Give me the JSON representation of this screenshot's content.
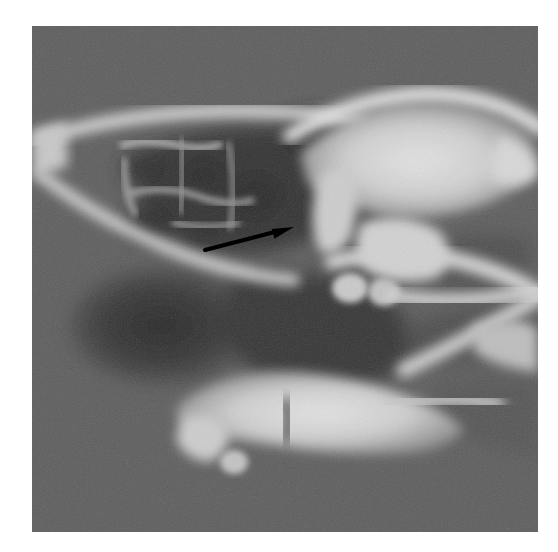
{
  "image": {
    "modality": "CT",
    "type": "axial-temporal-bone-ct",
    "region": "temporal bone / petrous apex",
    "rendering": "grayscale",
    "frame": {
      "x": 32,
      "y": 26,
      "width": 506,
      "height": 506
    },
    "page": {
      "width": 558,
      "height": 552,
      "background": "#ffffff"
    }
  },
  "palette": {
    "page_background": "#ffffff",
    "soft_tissue_background": "#5e5e5e",
    "air_cell_dark": "#2d2d2d",
    "mid_gray": "#747474",
    "bone_bright": "#ededed",
    "bone_mid": "#c6c6c6",
    "annotation_black": "#000000"
  },
  "annotations": [
    {
      "name": "pointer-arrow",
      "shape": "arrow",
      "color": "#000000",
      "tail": {
        "x": 173,
        "y": 224
      },
      "tip": {
        "x": 262,
        "y": 201
      },
      "stroke_width": 4,
      "head_length": 22,
      "head_width": 13,
      "label": ""
    }
  ],
  "anatomy": [
    {
      "name": "mastoid-air-cells",
      "tone": "dark",
      "cx": 150,
      "cy": 180
    },
    {
      "name": "outer-cortical-bone-line",
      "tone": "bright",
      "cx": 120,
      "cy": 140
    },
    {
      "name": "petrous-apex",
      "tone": "bright",
      "cx": 360,
      "cy": 180
    },
    {
      "name": "internal-auditory-canal",
      "tone": "dark",
      "cx": 390,
      "cy": 155
    },
    {
      "name": "sigmoid-sinus-plate",
      "tone": "dark",
      "cx": 130,
      "cy": 300
    },
    {
      "name": "occipital-bone",
      "tone": "bright",
      "cx": 250,
      "cy": 380
    },
    {
      "name": "clivus-margin",
      "tone": "bright",
      "cx": 440,
      "cy": 300
    }
  ],
  "chart_data": {
    "type": "heatmap",
    "title": "",
    "xlabel": "",
    "ylabel": "",
    "grid": false,
    "legend": "none",
    "value_range": [
      0,
      255
    ],
    "colormap": "grayscale"
  }
}
